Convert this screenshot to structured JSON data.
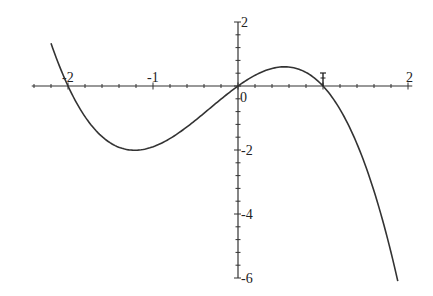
{
  "chart_data": {
    "type": "line",
    "title": "",
    "xlabel": "",
    "ylabel": "",
    "xlim": [
      -2.45,
      2.05
    ],
    "ylim": [
      -6,
      2
    ],
    "grid": false,
    "legend": null,
    "x_tick_labels": [
      {
        "value": -2,
        "label": "-2"
      },
      {
        "value": -1,
        "label": "-1"
      },
      {
        "value": 0,
        "label": "0"
      },
      {
        "value": 2,
        "label": "2"
      }
    ],
    "y_tick_labels": [
      {
        "value": 2,
        "label": "2"
      },
      {
        "value": -2,
        "label": "-2"
      },
      {
        "value": -4,
        "label": "-4"
      },
      {
        "value": -6,
        "label": "-6"
      }
    ],
    "x_minor_step": 0.2,
    "y_minor_step": 0.4,
    "series": [
      {
        "name": "f(x)",
        "function": "y = -0.95*x*(x+2)*(x-1)",
        "x_range": [
          -2.2,
          1.88
        ],
        "x": [
          -2.2,
          -2.0,
          -1.8,
          -1.6,
          -1.4,
          -1.2,
          -1.0,
          -0.8,
          -0.6,
          -0.4,
          -0.2,
          0.0,
          0.2,
          0.4,
          0.6,
          0.8,
          1.0,
          1.2,
          1.4,
          1.6,
          1.8,
          1.88
        ],
        "y": [
          1.34,
          0.0,
          -0.96,
          -1.58,
          -1.92,
          -2.01,
          -1.9,
          -1.64,
          -1.27,
          -0.85,
          -0.42,
          0.0,
          0.34,
          0.55,
          0.59,
          0.43,
          0.0,
          -0.73,
          -1.82,
          -3.28,
          -5.13,
          -5.98
        ],
        "color": "#333333"
      }
    ],
    "annotations": [
      {
        "type": "marker",
        "x": 1,
        "y": 0,
        "description": "small vertical I-bar marker at x-intercept 1"
      }
    ]
  }
}
